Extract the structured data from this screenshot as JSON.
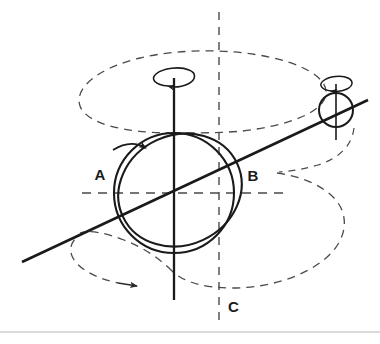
{
  "figure": {
    "background_color": "#ffffff",
    "stroke_color": "#1a1a1a",
    "dashed_color": "#4a4a4a",
    "rule_color": "#b4b4b4",
    "width": 380,
    "height": 344
  },
  "labels": {
    "a": "A",
    "b": "B",
    "c": "C"
  },
  "elements": {
    "main_body_name": "spinning-sphere",
    "tilted_ring_name": "tilted-equator-ellipse",
    "spin_axis_name": "vertical-spin-axis",
    "orbit_axis_name": "tilted-orbital-axis-line",
    "vertical_reference_name": "vertical-dashed-reference-line",
    "horizontal_reference_name": "horizontal-dashed-reference-line",
    "precession_upper_name": "upper-precession-dashed-ellipse",
    "precession_lower_name": "lower-precession-dashed-ellipse",
    "satellite_name": "satellite-circle",
    "spin_arrow_name": "spin-rotation-arrow",
    "satellite_spin_arrow_name": "satellite-rotation-arrow",
    "body_rotation_arrow_name": "body-rotation-arrow",
    "precession_arrow_name": "precession-direction-arrow",
    "bottom_rule_name": "bottom-horizontal-rule"
  },
  "geometry": {
    "sphere_center": [
      174,
      193
    ],
    "sphere_radius": 60,
    "satellite_center": [
      336,
      110
    ],
    "satellite_radius": 17,
    "spin_axis_top": [
      174,
      78
    ],
    "spin_axis_bottom": [
      174,
      300
    ],
    "orbit_line_start": [
      22,
      262
    ],
    "orbit_line_end": [
      368,
      100
    ],
    "vertical_dash_x": 219,
    "horizontal_dash_y": 193,
    "bottom_rule_y": 332
  }
}
